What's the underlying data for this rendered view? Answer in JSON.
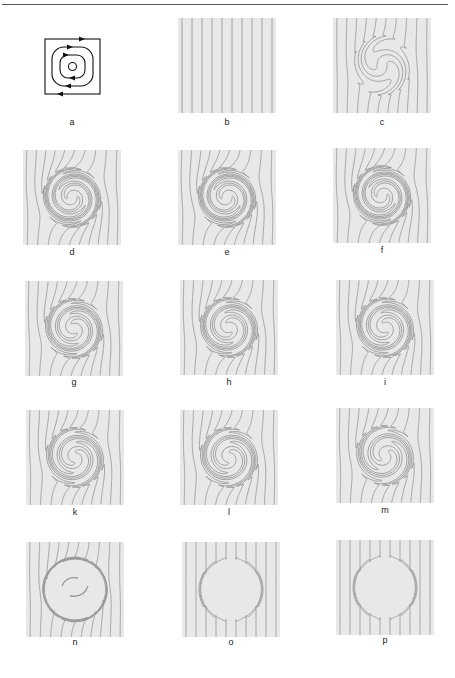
{
  "figure": {
    "panels": [
      {
        "id": "a",
        "label": "a",
        "kind": "schematic",
        "x": 45,
        "y": 39,
        "w": 55,
        "h": 55,
        "label_y": 117,
        "col_x": 23
      },
      {
        "id": "b",
        "label": "b",
        "kind": "uniform",
        "x": 178,
        "y": 18,
        "label_y": 117,
        "twist": 0
      },
      {
        "id": "c",
        "label": "c",
        "kind": "s-fold",
        "x": 333,
        "y": 18,
        "label_y": 117,
        "twist": 1
      },
      {
        "id": "d",
        "label": "d",
        "kind": "spiral",
        "x": 23,
        "y": 150,
        "label_y": 247,
        "twist": 3
      },
      {
        "id": "e",
        "label": "e",
        "kind": "spiral",
        "x": 178,
        "y": 150,
        "label_y": 247,
        "twist": 3
      },
      {
        "id": "f",
        "label": "f",
        "kind": "spiral",
        "x": 333,
        "y": 148,
        "label_y": 245,
        "twist": 3
      },
      {
        "id": "g",
        "label": "g",
        "kind": "spiral",
        "x": 25,
        "y": 281,
        "label_y": 377,
        "twist": 2.6
      },
      {
        "id": "h",
        "label": "h",
        "kind": "spiral",
        "x": 180,
        "y": 280,
        "label_y": 377,
        "twist": 2.6
      },
      {
        "id": "i",
        "label": "i",
        "kind": "spiral",
        "x": 336,
        "y": 280,
        "label_y": 377,
        "twist": 2.6
      },
      {
        "id": "k",
        "label": "k",
        "kind": "spiral",
        "x": 26,
        "y": 410,
        "label_y": 507,
        "twist": 2.4
      },
      {
        "id": "l",
        "label": "l",
        "kind": "spiral",
        "x": 180,
        "y": 410,
        "label_y": 507,
        "twist": 2.4
      },
      {
        "id": "m",
        "label": "m",
        "kind": "spiral",
        "x": 336,
        "y": 408,
        "label_y": 505,
        "twist": 2.2
      },
      {
        "id": "n",
        "label": "n",
        "kind": "breakup",
        "x": 26,
        "y": 542,
        "label_y": 637,
        "twist": 1.5
      },
      {
        "id": "o",
        "label": "o",
        "kind": "void",
        "x": 182,
        "y": 542,
        "label_y": 637,
        "twist": 0
      },
      {
        "id": "p",
        "label": "p",
        "kind": "void",
        "x": 336,
        "y": 540,
        "label_y": 635,
        "twist": 0
      }
    ]
  },
  "colors": {
    "panel_bg": "#e8e8e8",
    "tracer_line": "#9a9a9a",
    "schematic_line": "#111111",
    "rule": "#555555"
  }
}
